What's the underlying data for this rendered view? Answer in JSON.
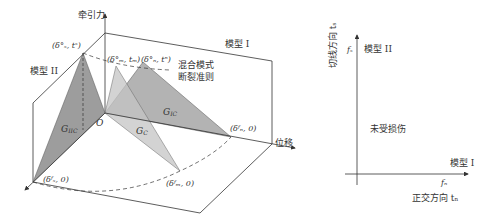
{
  "left_diagram": {
    "y_axis_label": "牵引力",
    "x_axis_label": "位移",
    "plane_mode1_label": "模型 I",
    "plane_mode2_label": "模型 II",
    "mixed_criterion_label_line1": "混合模式",
    "mixed_criterion_label_line2": "断裂准则",
    "origin_label": "O",
    "points": {
      "mode2_peak": "(δ°ₛ, tˢ)",
      "mixed_peak": "(δ°ₘ, tₘ)",
      "mode1_peak": "(δ°ₙ, tⁿ)",
      "mode1_final": "(δᶠₙ, 0)",
      "mode2_final": "(δᶠₛ, 0)",
      "mixed_final": "(δᶠₘ, 0)"
    },
    "areas": {
      "mode1": "G",
      "mode1_sub": "IC",
      "mode2": "G",
      "mode2_sub": "IIC",
      "mixed": "G",
      "mixed_sub": "C"
    },
    "colors": {
      "mode2_triangle": "#8c8c8c",
      "mode1_triangle": "#a6a6a6",
      "mixed_triangle": "#c4c4c4",
      "line": "#333333"
    }
  },
  "right_diagram": {
    "y_axis_label": "切线方向 tₛ",
    "y_axis_symbol": "fₛ",
    "x_axis_label": "正交方向 tₙ",
    "x_axis_symbol": "fₙ",
    "mode2_label": "模型 II",
    "mode1_label": "模型 I",
    "region_label": "未受损伤"
  }
}
